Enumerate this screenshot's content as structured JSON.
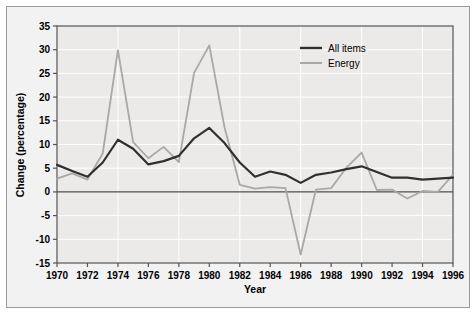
{
  "chart_data": {
    "type": "line",
    "title": "",
    "xlabel": "Year",
    "ylabel": "Change (percentage)",
    "xlim": [
      1970,
      1996
    ],
    "ylim": [
      -15,
      35
    ],
    "ytick_labels": [
      "35",
      "30",
      "25",
      "20",
      "15",
      "10",
      "5",
      "0",
      "-5",
      "-10",
      "-15"
    ],
    "yticks": [
      35,
      30,
      25,
      20,
      15,
      10,
      5,
      0,
      -5,
      -10,
      -15
    ],
    "xtick_labels": [
      "1970",
      "1972",
      "1974",
      "1976",
      "1978",
      "1980",
      "1982",
      "1984",
      "1986",
      "1988",
      "1990",
      "1992",
      "1994",
      "1996"
    ],
    "xticks": [
      1970,
      1972,
      1974,
      1976,
      1978,
      1980,
      1982,
      1984,
      1986,
      1988,
      1990,
      1992,
      1994,
      1996
    ],
    "grid": true,
    "legend_position": "top-right",
    "x": [
      1970,
      1971,
      1972,
      1973,
      1974,
      1975,
      1976,
      1977,
      1978,
      1979,
      1980,
      1981,
      1982,
      1983,
      1984,
      1985,
      1986,
      1987,
      1988,
      1989,
      1990,
      1991,
      1992,
      1993,
      1994,
      1995,
      1996
    ],
    "series": [
      {
        "name": "All items",
        "color": "#303030",
        "values": [
          5.7,
          4.4,
          3.2,
          6.2,
          11.0,
          9.1,
          5.8,
          6.5,
          7.6,
          11.3,
          13.5,
          10.3,
          6.2,
          3.2,
          4.3,
          3.6,
          1.9,
          3.6,
          4.1,
          4.8,
          5.4,
          4.2,
          3.0,
          3.0,
          2.6,
          2.8,
          3.0
        ]
      },
      {
        "name": "Energy",
        "color": "#a8a8a8",
        "values": [
          2.8,
          3.9,
          2.6,
          8.1,
          29.9,
          10.5,
          7.1,
          9.5,
          6.3,
          25.1,
          30.9,
          13.6,
          1.5,
          0.7,
          1.0,
          0.8,
          -13.2,
          0.5,
          0.8,
          5.1,
          8.3,
          0.4,
          0.5,
          -1.4,
          0.2,
          0.0,
          3.6
        ]
      }
    ]
  },
  "legend": {
    "items": [
      {
        "label": "All items",
        "color": "#303030"
      },
      {
        "label": "Energy",
        "color": "#a8a8a8"
      }
    ]
  },
  "axes": {
    "x_title": "Year",
    "y_title": "Change (percentage)"
  }
}
